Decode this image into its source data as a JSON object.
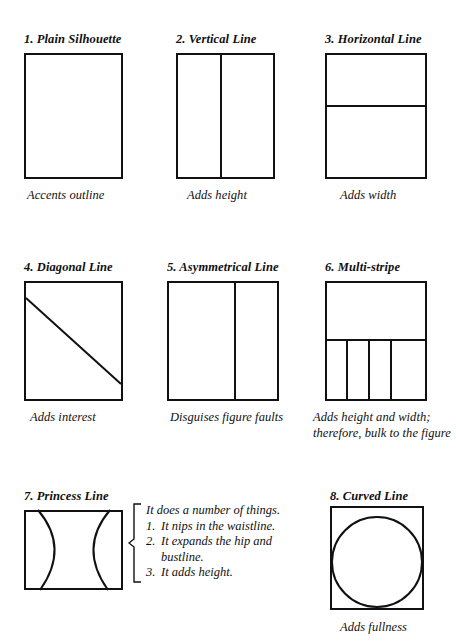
{
  "figure": {
    "type": "instructional-diagram",
    "items": [
      {
        "number": "1.",
        "title": "1. Plain Silhouette",
        "caption": "Accents outline",
        "line_type": "none"
      },
      {
        "number": "2.",
        "title": "2. Vertical Line",
        "caption": "Adds height",
        "line_type": "vertical-center"
      },
      {
        "number": "3.",
        "title": "3. Horizontal Line",
        "caption": "Adds width",
        "line_type": "horizontal"
      },
      {
        "number": "4.",
        "title": "4. Diagonal Line",
        "caption": "Adds interest",
        "line_type": "diagonal"
      },
      {
        "number": "5.",
        "title": "5. Asymmetrical Line",
        "caption": "Disguises figure faults",
        "line_type": "vertical-offcenter"
      },
      {
        "number": "6.",
        "title": "6. Multi-stripe",
        "caption": "Adds height and width; therefore, bulk to the figure",
        "line_type": "multi-stripe"
      },
      {
        "number": "7.",
        "title": "7. Princess Line",
        "caption": "",
        "line_type": "princess-curves"
      },
      {
        "number": "8.",
        "title": "8. Curved Line",
        "caption": "Adds fullness",
        "line_type": "circle"
      }
    ],
    "princess_note": {
      "lead": "It does a number of things.",
      "items": [
        {
          "num": "1.",
          "text": "It nips in the waistline."
        },
        {
          "num": "2.",
          "text": "It expands the hip and bustline."
        },
        {
          "num": "3.",
          "text": "It adds height."
        }
      ]
    },
    "colors": {
      "ink": "#111111",
      "paper": "#ffffff"
    }
  }
}
